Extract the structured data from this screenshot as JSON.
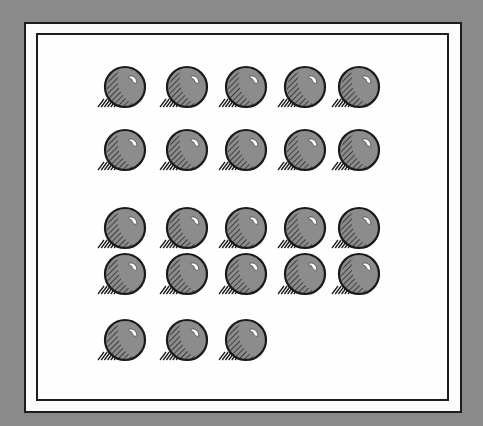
{
  "figure": {
    "background_color": "#8a8a8a",
    "panel_color": "#fdfdfd",
    "border_color": "#1c1c1c",
    "ball_fill": "#8c8c8c",
    "ball_outline": "#1a1a1a",
    "ball_radius": 20,
    "total_balls": 23,
    "rows": [
      {
        "count": 5,
        "y": 87,
        "x": [
          125,
          187,
          246,
          305,
          359
        ]
      },
      {
        "count": 5,
        "y": 150,
        "x": [
          125,
          187,
          246,
          305,
          359
        ]
      },
      {
        "count": 5,
        "y": 228,
        "x": [
          125,
          187,
          246,
          305,
          359
        ]
      },
      {
        "count": 5,
        "y": 274,
        "x": [
          125,
          187,
          246,
          305,
          359
        ]
      },
      {
        "count": 3,
        "y": 340,
        "x": [
          125,
          187,
          246
        ]
      }
    ]
  }
}
